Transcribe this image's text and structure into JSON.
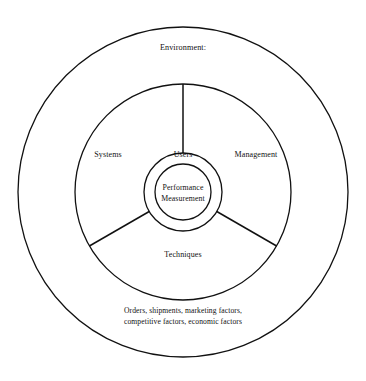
{
  "diagram": {
    "type": "concentric-circle-sector-diagram",
    "background_color": "#ffffff",
    "stroke_color": "#111111",
    "center": {
      "x": 183,
      "y": 192
    },
    "rings": [
      {
        "name": "outer-environment-ring",
        "radius": 165,
        "stroke_width": 1.3
      },
      {
        "name": "middle-stakeholder-ring",
        "radius": 108,
        "stroke_width": 1.3
      },
      {
        "name": "inner-ring",
        "radius": 39,
        "stroke_width": 1.3
      },
      {
        "name": "core-circle",
        "radius": 28,
        "stroke_width": 1.3
      }
    ],
    "spokes": [
      {
        "name": "spoke-up",
        "angle_deg": 90,
        "inner_radius": 39,
        "outer_radius": 108
      },
      {
        "name": "spoke-lower-left",
        "angle_deg": 210,
        "inner_radius": 39,
        "outer_radius": 108
      },
      {
        "name": "spoke-lower-right",
        "angle_deg": 330,
        "inner_radius": 39,
        "outer_radius": 108
      }
    ],
    "core": {
      "line1": "Performance",
      "line2": "Measurement"
    },
    "inner_ring_label": "Users",
    "sectors": [
      {
        "name": "systems",
        "label": "Systems"
      },
      {
        "name": "management",
        "label": "Management"
      },
      {
        "name": "techniques",
        "label": "Techniques"
      }
    ],
    "outer_band": {
      "top_label": "Environment:",
      "bottom_label_line1": "Orders, shipments, marketing factors,",
      "bottom_label_line2": "competitive factors, economic factors"
    }
  }
}
